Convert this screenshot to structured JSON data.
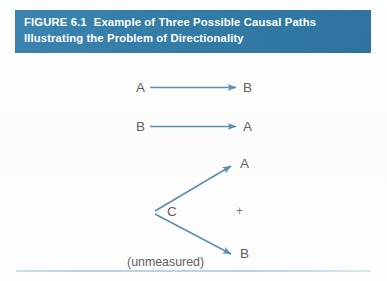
{
  "figure": {
    "header": {
      "figure_number": "FIGURE 6.1",
      "title_line1": "Example of Three Possible Causal Paths",
      "title_line2": "Illustrating the Problem of Directionality",
      "background_color": "#2f7cab",
      "text_color": "#ffffff"
    },
    "arrow_color": "#5b8fb0",
    "label_color": "#5f6163",
    "rule_color": "#bcd5e2",
    "diagrams": [
      {
        "id": "path-1",
        "description": "A causes B",
        "from": "A",
        "to": "B"
      },
      {
        "id": "path-2",
        "description": "B causes A",
        "from": "B",
        "to": "A"
      },
      {
        "id": "path-3",
        "description": "C causes both A and B",
        "from": "C",
        "to_upper": "A",
        "to_lower": "B",
        "operator": "+",
        "note": "(unmeasured)"
      }
    ]
  }
}
